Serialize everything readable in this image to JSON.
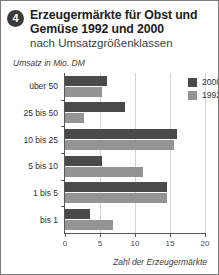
{
  "header": {
    "badge_number": "4",
    "title_line1": "Erzeugermärkte für Obst und",
    "title_line2": "Gemüse 1992 und 2000",
    "subtitle": "nach Umsatzgrößenklassen"
  },
  "colors": {
    "series_2000": "#4a4a4a",
    "series_1992": "#949494",
    "axis": "#575757",
    "grid": "#d3d3d3",
    "background": "#ffffff",
    "border": "#7a7a7a"
  },
  "chart_data": {
    "type": "bar",
    "orientation": "horizontal",
    "title": "Erzeugermärkte für Obst und Gemüse 1992 und 2000",
    "subtitle": "nach Umsatzgrößenklassen",
    "ylabel": "Umsatz in Mio. DM",
    "xlabel": "Zahl der Erzeugermärkte",
    "categories": [
      "über 50",
      "25 bis 50",
      "10 bis 25",
      "5 bis 10",
      "1 bis 5",
      "bis 1"
    ],
    "series": [
      {
        "name": "2000",
        "color": "#4a4a4a",
        "values": [
          6.0,
          8.5,
          16.0,
          5.3,
          14.6,
          3.6
        ]
      },
      {
        "name": "1992",
        "color": "#949494",
        "values": [
          5.3,
          2.7,
          15.6,
          11.1,
          14.6,
          6.8
        ]
      }
    ],
    "xlim": [
      0,
      20
    ],
    "xticks": [
      "0",
      "5",
      "10",
      "15",
      "20"
    ],
    "xtick_values": [
      0,
      5,
      10,
      15,
      20
    ],
    "grid": true,
    "grid_axis": "x",
    "legend_position": "top-right",
    "legend_entries": [
      "2000",
      "1992"
    ]
  }
}
